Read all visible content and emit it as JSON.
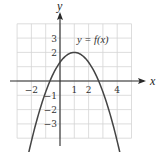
{
  "chart_data": {
    "type": "line",
    "title": "",
    "xlabel": "x",
    "ylabel": "y",
    "annotations": [
      "y = f(x)"
    ],
    "xlim": [
      -3,
      5
    ],
    "ylim": [
      -4,
      4
    ],
    "grid": true,
    "x_tick_labels": [
      "-2",
      "1",
      "2",
      "4"
    ],
    "y_tick_labels": [
      "3",
      "2",
      "-1",
      "-2",
      "-3"
    ],
    "series": [
      {
        "name": "y = f(x)",
        "description": "Downward-opening parabola with vertex at (1, 2), x-intercepts near -0.7 and 2.7, arrows at both ends",
        "x": [
          -2.2,
          -1.5,
          -1,
          -0.7,
          0,
          0.5,
          1,
          1.5,
          2,
          2.7,
          3,
          3.5,
          4.2
        ],
        "y": [
          -5.07,
          -2.31,
          -0.76,
          0.0,
          1.31,
          1.83,
          2.0,
          1.83,
          1.31,
          0.0,
          -0.76,
          -2.31,
          -5.07
        ]
      }
    ],
    "vertex": [
      1,
      2
    ]
  },
  "labels": {
    "x_axis": "x",
    "y_axis": "y",
    "function": "y = f(x)",
    "xticks": [
      {
        "value": -2,
        "text": "−2"
      },
      {
        "value": 1,
        "text": "1"
      },
      {
        "value": 2,
        "text": "2"
      },
      {
        "value": 4,
        "text": "4"
      }
    ],
    "yticks": [
      {
        "value": 3,
        "text": "3"
      },
      {
        "value": 2,
        "text": "2"
      },
      {
        "value": -1,
        "text": "−1"
      },
      {
        "value": -2,
        "text": "−2"
      },
      {
        "value": -3,
        "text": "−3"
      }
    ]
  },
  "colors": {
    "grid": "#d4d4d4",
    "axis": "#2a2a2a",
    "curve": "#444444"
  }
}
